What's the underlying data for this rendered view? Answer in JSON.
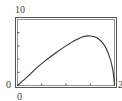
{
  "chart_data": {
    "type": "line",
    "title": "",
    "xlabel": "",
    "ylabel": "",
    "xlim": [
      0,
      2
    ],
    "ylim": [
      0,
      10
    ],
    "grid": false,
    "x_tick_labels": {
      "min": "0",
      "max": "2"
    },
    "y_tick_labels": {
      "min": "0",
      "max": "10"
    },
    "x_ticks": [
      0.5,
      1.0,
      1.5
    ],
    "y_ticks": [
      2,
      4,
      6,
      8
    ],
    "series": [
      {
        "name": "curve",
        "x": [
          0,
          0.2,
          0.4,
          0.6,
          0.8,
          1.0,
          1.2,
          1.35,
          1.5,
          1.65,
          1.8,
          1.9,
          1.95,
          1.98,
          2.0
        ],
        "y": [
          0,
          1.3,
          2.7,
          3.9,
          5.0,
          6.0,
          6.9,
          7.4,
          7.5,
          7.2,
          6.0,
          4.3,
          2.9,
          1.6,
          0
        ]
      }
    ]
  },
  "labels": {
    "y_max": "10",
    "y_min": "0",
    "x_min": "0",
    "x_max": "2"
  },
  "colors": {
    "frame": "#555555",
    "curve": "#333333",
    "text": "#3a3a3a"
  }
}
